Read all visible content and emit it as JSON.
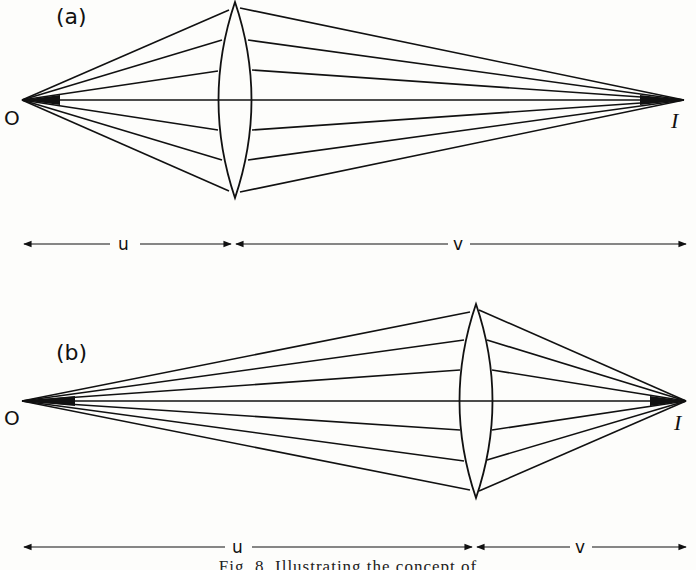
{
  "figure": {
    "caption": "Fig. 8. Illustrating the concept of",
    "panels": [
      {
        "id": "a",
        "label": "(a)",
        "object_label": "O",
        "image_label": "I",
        "distance_u_label": "u",
        "distance_v_label": "v",
        "object_x": 22,
        "axis_y": 100,
        "lens_x": 236,
        "lens_top": 2,
        "lens_bottom": 198,
        "image_x": 684,
        "ray_heights_at_lens": [
          -62,
          -30,
          -15,
          0,
          15,
          30,
          62
        ],
        "dim_y": 243,
        "dim_left": 22,
        "dim_split": 233,
        "dim_right": 686
      },
      {
        "id": "b",
        "label": "(b)",
        "object_label": "O",
        "image_label": "I",
        "distance_u_label": "u",
        "distance_v_label": "v",
        "object_x": 22,
        "axis_y": 401,
        "lens_x": 476,
        "lens_top": 304,
        "lens_bottom": 498,
        "image_x": 686,
        "ray_heights_at_lens": [
          -90,
          -60,
          -29,
          0,
          30,
          60,
          89
        ],
        "dim_y": 547,
        "dim_left": 22,
        "dim_split": 474,
        "dim_right": 686
      }
    ]
  }
}
